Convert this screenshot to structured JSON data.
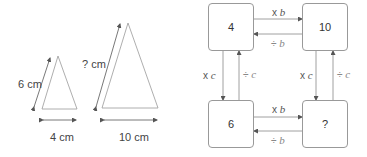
{
  "triangles": {
    "small": {
      "side_label": "6 cm",
      "base_label": "4 cm"
    },
    "large": {
      "side_label": "? cm",
      "base_label": "10 cm"
    }
  },
  "grid": {
    "boxes": {
      "top_left": "4",
      "top_right": "10",
      "bottom_left": "6",
      "bottom_right": "?"
    },
    "ops": {
      "top_forward": {
        "sym": "x",
        "var": "b"
      },
      "top_backward": {
        "sym": "÷",
        "var": "b"
      },
      "bottom_forward": {
        "sym": "x",
        "var": "b"
      },
      "bottom_backward": {
        "sym": "÷",
        "var": "b"
      },
      "left_down": {
        "sym": "x",
        "var": "c"
      },
      "left_up": {
        "sym": "÷",
        "var": "c"
      },
      "right_down": {
        "sym": "x",
        "var": "c"
      },
      "right_up": {
        "sym": "÷",
        "var": "c"
      }
    }
  },
  "colors": {
    "line": "#8a8a8a",
    "arrow": "#555555",
    "text": "#444444"
  }
}
